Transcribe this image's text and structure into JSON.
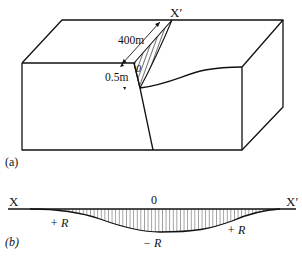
{
  "figure_a": {
    "panel_label": "(a)",
    "endpoint_label": "X′",
    "length_label": "400m",
    "offset_label": "0.5m",
    "origin_label": "0"
  },
  "figure_b": {
    "panel_label": "(b)",
    "left_label": "X",
    "right_label": "X′",
    "center_label": "0",
    "left_value_label": "+ R",
    "center_value_label": "− R",
    "right_value_label": "+ R"
  },
  "colors": {
    "line": "#111111",
    "background": "#ffffff"
  }
}
